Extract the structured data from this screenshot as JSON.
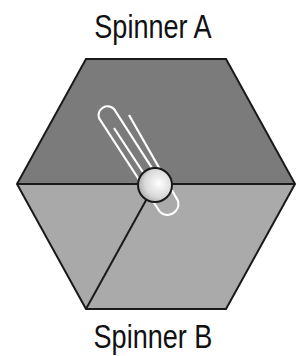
{
  "figure": {
    "title_top": "Spinner A",
    "title_bottom": "Spinner B",
    "spinner": {
      "shape": "hexagon",
      "sections": [
        {
          "name": "top-half",
          "fraction": "1/2",
          "color": "#7a7a7a"
        },
        {
          "name": "lower-left",
          "fraction": "1/6",
          "color": "#a9a9a9"
        },
        {
          "name": "lower-right",
          "fraction": "1/3",
          "color": "#a9a9a9"
        }
      ],
      "pointer": "paperclip",
      "pivot": "ball"
    },
    "colors": {
      "dark_section": "#7a7a7a",
      "light_section": "#a9a9a9",
      "outline": "#1a1a1a"
    }
  }
}
